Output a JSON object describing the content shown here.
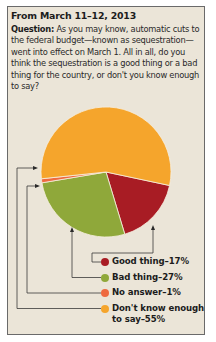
{
  "header": {
    "date": "From March 11–12, 2013",
    "question_label": "Question:",
    "question_text": "As you may know, automatic cuts to the federal budget—known as sequestration—went into effect on March 1. All in all, do you think the sequestration is a good thing or a bad thing for the country, or don't you know enough to say?"
  },
  "colors": {
    "panel_bg": "#ebe5d8",
    "good": "#a81c24",
    "bad": "#8fa83a",
    "no_answer": "#ee6a40",
    "dont_know": "#f5a52c"
  },
  "legend": [
    {
      "label": "Good thing–17%",
      "color": "#a81c24"
    },
    {
      "label": "Bad thing–27%",
      "color": "#8fa83a"
    },
    {
      "label": "No answer–1%",
      "color": "#ee6a40"
    },
    {
      "label": "Don't know enough to say–55%",
      "color": "#f5a52c"
    }
  ],
  "chart_data": {
    "type": "pie",
    "title": "From March 11–12, 2013",
    "subtitle": "Question: As you may know, automatic cuts to the federal budget—known as sequestration—went into effect on March 1. All in all, do you think the sequestration is a good thing or a bad thing for the country, or don't you know enough to say?",
    "categories": [
      "Good thing",
      "Bad thing",
      "No answer",
      "Don't know enough to say"
    ],
    "values": [
      17,
      27,
      1,
      55
    ],
    "unit": "%",
    "colors": [
      "#a81c24",
      "#8fa83a",
      "#ee6a40",
      "#f5a52c"
    ],
    "legend_position": "bottom-right"
  }
}
